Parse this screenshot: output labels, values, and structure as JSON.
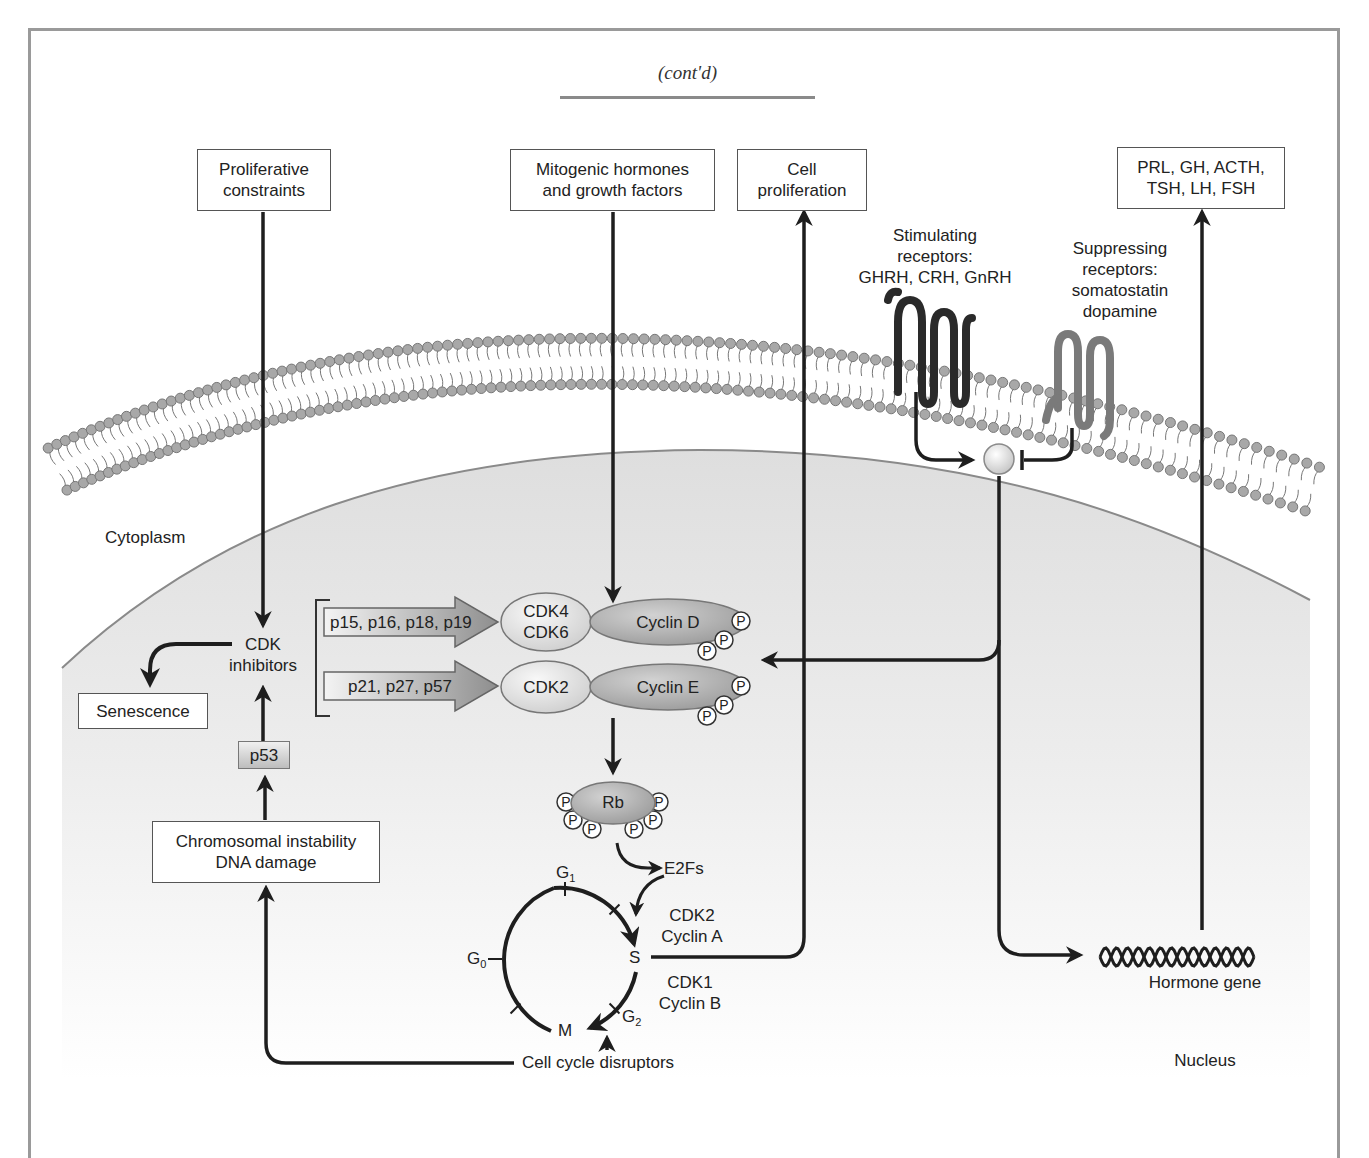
{
  "header": {
    "continuation": "(cont'd)"
  },
  "top_boxes": {
    "proliferative_constraints": [
      "Proliferative",
      "constraints"
    ],
    "mitogenic": [
      "Mitogenic hormones",
      "and growth factors"
    ],
    "cell_proliferation": [
      "Cell",
      "proliferation"
    ],
    "hormones_out": [
      "PRL, GH, ACTH,",
      "TSH, LH, FSH"
    ]
  },
  "receptors": {
    "stimulating": [
      "Stimulating",
      "receptors:",
      "GHRH, CRH, GnRH"
    ],
    "suppressing": [
      "Suppressing",
      "receptors:",
      "somatostatin",
      "dopamine"
    ]
  },
  "compartments": {
    "cytoplasm": "Cytoplasm",
    "nucleus": "Nucleus"
  },
  "inhibitors": {
    "cdk_inhibitors": [
      "CDK",
      "inhibitors"
    ],
    "ink4": "p15, p16, p18, p19",
    "cip_kip": "p21, p27, p57",
    "senescence": "Senescence",
    "p53": "p53",
    "chromosomal": [
      "Chromosomal instability",
      "DNA damage"
    ]
  },
  "complexes": {
    "cdk46": [
      "CDK4",
      "CDK6"
    ],
    "cyclin_d": "Cyclin D",
    "cdk2": "CDK2",
    "cyclin_e": "Cyclin E",
    "phospho": "P",
    "rb": "Rb",
    "e2fs": "E2Fs"
  },
  "cell_cycle": {
    "g0": "G",
    "g0_sub": "0",
    "g1": "G",
    "g1_sub": "1",
    "g2": "G",
    "g2_sub": "2",
    "s": "S",
    "m": "M",
    "cdk2_cyclin_a": [
      "CDK2",
      "Cyclin A"
    ],
    "cdk1_cyclin_b": [
      "CDK1",
      "Cyclin B"
    ],
    "disruptors": "Cell cycle disruptors"
  },
  "gene": {
    "label": "Hormone gene"
  },
  "colors": {
    "frame": "#9a9a9a",
    "line": "#1e1e1e",
    "lipid_head": "#a8a8a8",
    "stim_receptor": "#2a2a2a",
    "supp_receptor": "#7a7a7a",
    "nucleus_fill": "#e4e4e4"
  }
}
